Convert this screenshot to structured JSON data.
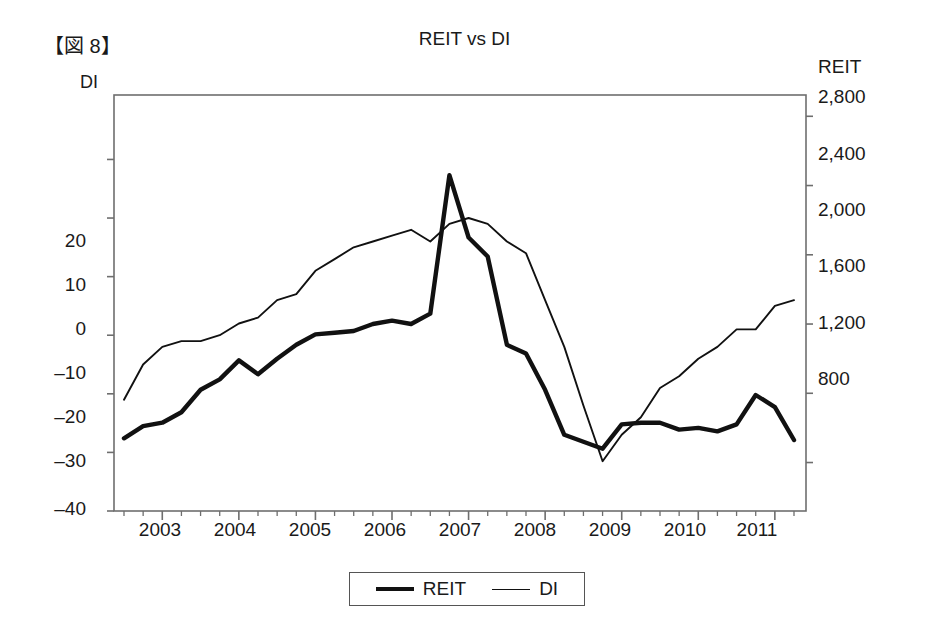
{
  "figure_label": "【図 8】",
  "title": "REIT vs DI",
  "left_axis": {
    "name": "DI",
    "ticks": [
      20,
      10,
      0,
      -10,
      -20,
      -30,
      -40
    ],
    "tick_labels": [
      "20",
      "10",
      "0",
      "–10",
      "–20",
      "–30",
      "–40"
    ],
    "range": [
      -40,
      31
    ]
  },
  "right_axis": {
    "name": "REIT",
    "ticks": [
      2800,
      2400,
      2000,
      1600,
      1200,
      800
    ],
    "tick_labels": [
      "2,800",
      "2,400",
      "2,000",
      "1,600",
      "1,200",
      "800"
    ],
    "range": [
      520,
      2923
    ]
  },
  "x_axis": {
    "tick_labels": [
      "2003",
      "2004",
      "2005",
      "2006",
      "2007",
      "2008",
      "2009",
      "2010",
      "2011"
    ],
    "minor_ticks_per_year": 4
  },
  "legend": {
    "items": [
      {
        "label": "REIT",
        "style": "thick-line",
        "color": "#111111"
      },
      {
        "label": "DI",
        "style": "thin-line",
        "color": "#111111"
      }
    ]
  },
  "colors": {
    "reit_line": "#111111",
    "di_line": "#111111",
    "axis": "#6e6e6e",
    "text": "#1a1a1a"
  },
  "chart_data": {
    "type": "line",
    "title": "REIT vs DI",
    "xlabel": "",
    "ylabel": "DI",
    "y2label": "REIT",
    "grid": false,
    "legend_position": "bottom",
    "xlim": [
      "2002Q3",
      "2011Q2"
    ],
    "ylim": [
      -40,
      31
    ],
    "y2lim": [
      520,
      2923
    ],
    "x": [
      "2002Q3",
      "2002Q4",
      "2003Q1",
      "2003Q2",
      "2003Q3",
      "2003Q4",
      "2004Q1",
      "2004Q2",
      "2004Q3",
      "2004Q4",
      "2005Q1",
      "2005Q2",
      "2005Q3",
      "2005Q4",
      "2006Q1",
      "2006Q2",
      "2006Q3",
      "2006Q4",
      "2007Q1",
      "2007Q2",
      "2007Q3",
      "2007Q4",
      "2008Q1",
      "2008Q2",
      "2008Q3",
      "2008Q4",
      "2009Q1",
      "2009Q2",
      "2009Q3",
      "2009Q4",
      "2010Q1",
      "2010Q2",
      "2010Q3",
      "2010Q4",
      "2011Q1",
      "2011Q2"
    ],
    "series": [
      {
        "name": "REIT",
        "axis": "right",
        "style": "thick-line",
        "values": [
          940,
          1010,
          1030,
          1090,
          1220,
          1280,
          1390,
          1310,
          1400,
          1480,
          1540,
          1550,
          1560,
          1600,
          1620,
          1600,
          1660,
          2460,
          2100,
          1990,
          1480,
          1430,
          1220,
          960,
          920,
          880,
          1020,
          1030,
          1030,
          990,
          1000,
          980,
          1020,
          1190,
          1120,
          930
        ],
        "labeled_note": "right-hand REIT scale, thick black line"
      },
      {
        "name": "DI",
        "axis": "left",
        "style": "thin-line",
        "values": [
          -21,
          -15,
          -12,
          -11,
          -11,
          -10,
          -8,
          -7,
          -4,
          -3,
          1,
          3,
          5,
          6,
          7,
          8,
          6,
          9,
          10,
          9,
          6,
          4,
          -4,
          -12,
          -22,
          -31.5,
          -27,
          -24,
          -19,
          -17,
          -14,
          -12,
          -9,
          -9,
          -5,
          -4
        ],
        "labeled_note": "left-hand DI scale, thin black line"
      }
    ],
    "annotations": [
      {
        "text": "REIT peak ≈ 2,460 at 2006Q4/2007",
        "series": "REIT"
      },
      {
        "text": "DI trough ≈ –31.5 at 2008Q4",
        "series": "DI"
      },
      {
        "text": "DI peak ≈ 10 at 2007Q1",
        "series": "DI"
      }
    ]
  }
}
